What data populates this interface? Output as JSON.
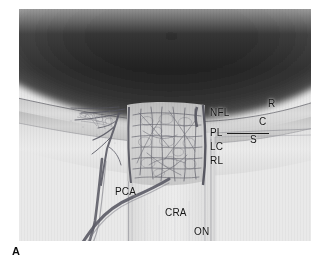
{
  "figure": {
    "panel_letter": "A",
    "caption_title": "Optic nerve head vascular anatomy",
    "modality": "light micrograph",
    "background_color": "#ffffff",
    "plate_color": "#e9e9e9",
    "vitreous_color": "#2a2a2a",
    "vessel_color": "#4a4a52",
    "label_color": "#161616"
  },
  "labels": {
    "nfl": "NFL",
    "pl": "PL",
    "lc": "LC",
    "rl": "RL",
    "r": "R",
    "c": "C",
    "s": "S",
    "pca": "PCA",
    "cra": "CRA",
    "on": "ON"
  },
  "label_meanings": {
    "nfl": "nerve fiber layer",
    "pl": "prelaminar region",
    "lc": "lamina cribrosa",
    "rl": "retrolaminar region",
    "r": "retina",
    "c": "choroid",
    "s": "sclera",
    "pca": "posterior ciliary artery",
    "cra": "central retinal artery",
    "on": "optic nerve"
  }
}
